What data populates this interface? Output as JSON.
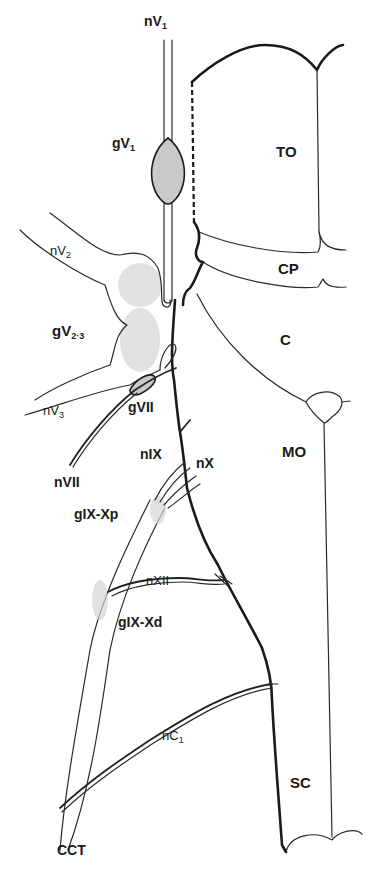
{
  "diagram": {
    "type": "anatomical line drawing",
    "labels": {
      "nV1": {
        "base": "nV",
        "sub": "1"
      },
      "gV1": {
        "base": "gV",
        "sub": "1"
      },
      "TO": {
        "base": "TO"
      },
      "nV2": {
        "base": "nV",
        "sub": "2"
      },
      "CP": {
        "base": "CP"
      },
      "gV23": {
        "base": "gV",
        "sub": "2·3"
      },
      "C": {
        "base": "C"
      },
      "nV3": {
        "base": "nV",
        "sub": "3"
      },
      "gVII": {
        "base": "gVII"
      },
      "MO": {
        "base": "MO"
      },
      "nVII": {
        "base": "nVII"
      },
      "nIX": {
        "base": "nIX"
      },
      "nX": {
        "base": "nX"
      },
      "gIXXp": {
        "base": "gIX-Xp"
      },
      "nXII": {
        "base": "nXII"
      },
      "gIXXd": {
        "base": "gIX-Xd"
      },
      "nC1": {
        "base": "nC",
        "sub": "1"
      },
      "SC": {
        "base": "SC"
      },
      "CCT": {
        "base": "CCT"
      }
    },
    "regions": [
      "TO",
      "CP",
      "C",
      "MO",
      "SC"
    ],
    "nerves": [
      "nV1",
      "nV2",
      "nV3",
      "nVII",
      "nIX",
      "nX",
      "nXII",
      "nC1"
    ],
    "ganglia": [
      "gV1",
      "gV2·3",
      "gVII",
      "gIX-Xp",
      "gIX-Xd"
    ],
    "colors": {
      "line": "#1a1a1a",
      "ganglion_fill": "#c9c9c9",
      "background": "#ffffff"
    }
  }
}
